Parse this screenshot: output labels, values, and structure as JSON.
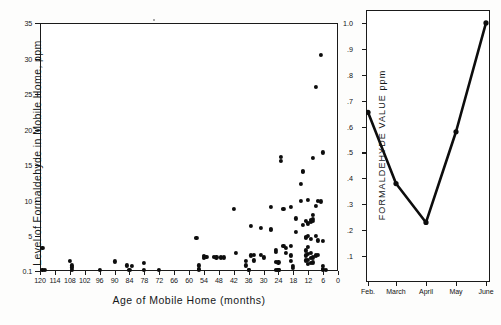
{
  "figure": {
    "background": "#fdfdfc",
    "ink_color": "#0d0d0d"
  },
  "chart_data": [
    {
      "type": "scatter",
      "id": "formaldehyde-vs-age",
      "title": "",
      "xlabel": "Age  of  Mobile  Home (months)",
      "ylabel": "Level of Formaldehyde in Mobile Home, ppm",
      "xlim": [
        120,
        0
      ],
      "ylim": [
        0.1,
        35
      ],
      "x_inverted": true,
      "grid": false,
      "legend": null,
      "xticks": [
        120,
        114,
        108,
        102,
        96,
        90,
        84,
        78,
        72,
        66,
        60,
        54,
        48,
        42,
        36,
        30,
        24,
        18,
        12,
        6,
        0
      ],
      "xticklabels": [
        "120",
        "114",
        "108",
        "102",
        "96",
        "90",
        "84",
        "78",
        "72",
        "66",
        "60",
        "54",
        "48",
        "42",
        "36",
        "30",
        "24",
        "18",
        "12",
        "6",
        "0"
      ],
      "yticks": [
        0.1,
        5,
        10,
        15,
        20,
        25,
        30,
        35
      ],
      "yticklabels": [
        "0.1",
        "5",
        "10",
        "15",
        "20",
        "25",
        "30",
        "35"
      ],
      "points": [
        [
          119,
          3.4
        ],
        [
          119,
          0.25
        ],
        [
          118,
          0.2
        ],
        [
          108,
          1.5
        ],
        [
          107,
          0.9
        ],
        [
          107,
          0.6
        ],
        [
          107,
          0.25
        ],
        [
          96,
          0.3
        ],
        [
          90,
          1.45
        ],
        [
          85,
          0.9
        ],
        [
          84,
          0.25
        ],
        [
          83,
          0.85
        ],
        [
          78,
          1.2
        ],
        [
          78,
          0.25
        ],
        [
          72,
          0.3
        ],
        [
          57,
          4.7
        ],
        [
          56,
          0.9
        ],
        [
          56,
          0.35
        ],
        [
          56,
          0.2
        ],
        [
          54,
          2.2
        ],
        [
          54,
          1.9
        ],
        [
          53,
          2.1
        ],
        [
          50,
          2.1
        ],
        [
          49,
          2.0
        ],
        [
          47,
          2.0
        ],
        [
          46,
          2.0
        ],
        [
          42,
          8.8
        ],
        [
          41,
          2.6
        ],
        [
          37,
          1.5
        ],
        [
          37,
          0.9
        ],
        [
          36,
          0.25
        ],
        [
          36,
          0.2
        ],
        [
          35,
          6.5
        ],
        [
          35,
          2.3
        ],
        [
          34,
          1.6
        ],
        [
          34,
          2.4
        ],
        [
          31,
          6.2
        ],
        [
          31,
          2.4
        ],
        [
          30,
          2.0
        ],
        [
          27,
          9.1
        ],
        [
          27,
          6.0
        ],
        [
          27,
          5.9
        ],
        [
          25,
          3.1
        ],
        [
          25,
          2.8
        ],
        [
          25,
          1.4
        ],
        [
          25,
          0.3
        ],
        [
          24,
          0.3
        ],
        [
          24,
          0.25
        ],
        [
          24,
          1.3
        ],
        [
          23,
          16.2
        ],
        [
          23,
          15.6
        ],
        [
          22,
          8.8
        ],
        [
          22,
          3.6
        ],
        [
          21,
          3.4
        ],
        [
          21,
          2.6
        ],
        [
          19,
          9.1
        ],
        [
          19,
          3.6
        ],
        [
          19,
          2.3
        ],
        [
          19,
          1.5
        ],
        [
          18,
          0.8
        ],
        [
          18,
          0.5
        ],
        [
          17,
          7.5
        ],
        [
          17,
          5.6
        ],
        [
          15,
          10.0
        ],
        [
          15,
          12.4
        ],
        [
          14,
          14.2
        ],
        [
          14,
          14.0
        ],
        [
          14,
          6.6
        ],
        [
          13,
          7.1
        ],
        [
          13,
          4.9
        ],
        [
          13,
          4.7
        ],
        [
          13,
          3.0
        ],
        [
          13,
          2.3
        ],
        [
          13,
          1.6
        ],
        [
          12,
          10.1
        ],
        [
          12,
          6.8
        ],
        [
          12,
          5.0
        ],
        [
          12,
          3.5
        ],
        [
          12,
          2.5
        ],
        [
          12,
          1.7
        ],
        [
          12,
          1.1
        ],
        [
          11,
          7.3
        ],
        [
          11,
          7.0
        ],
        [
          11,
          4.6
        ],
        [
          11,
          2.6
        ],
        [
          11,
          1.9
        ],
        [
          11,
          1.2
        ],
        [
          10,
          16.0
        ],
        [
          10,
          8.0
        ],
        [
          10,
          7.4
        ],
        [
          10,
          7.1
        ],
        [
          10,
          2.0
        ],
        [
          10,
          1.3
        ],
        [
          9,
          26.0
        ],
        [
          9,
          9.3
        ],
        [
          9,
          5.0
        ],
        [
          9,
          2.3
        ],
        [
          8,
          10.0
        ],
        [
          8,
          4.4
        ],
        [
          8,
          2.4
        ],
        [
          7,
          30.5
        ],
        [
          7,
          9.9
        ],
        [
          6,
          16.8
        ],
        [
          6,
          4.3
        ],
        [
          6,
          0.8
        ],
        [
          6,
          0.4
        ],
        [
          6,
          0.25
        ],
        [
          5,
          0.3
        ]
      ]
    },
    {
      "type": "line",
      "id": "monthly-formaldehyde-value",
      "title": "",
      "xlabel": "",
      "ylabel": "FORMALDEHYDE  VALUE  ppm",
      "categories": [
        "Feb.",
        "March",
        "April",
        "May",
        "June"
      ],
      "values": [
        0.655,
        0.38,
        0.23,
        0.58,
        1.0
      ],
      "ylim": [
        0,
        1.05
      ],
      "yticks": [
        0.1,
        0.2,
        0.3,
        0.4,
        0.5,
        0.6,
        0.7,
        0.8,
        0.9,
        1.0
      ],
      "yticklabels": [
        ".1",
        ".2",
        ".3",
        ".4",
        ".5",
        ".6",
        ".7",
        ".8",
        ".9",
        "1.0"
      ],
      "grid": false,
      "legend": null,
      "marker": "filled-circle",
      "line_color": "#0d0d0d"
    }
  ]
}
